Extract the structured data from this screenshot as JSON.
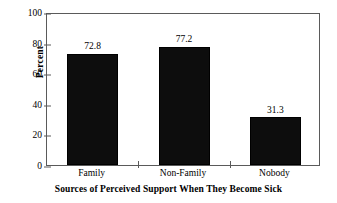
{
  "chart_data": {
    "type": "bar",
    "title": "",
    "subtitle": "",
    "xlabel": "Sources of Perceived Support When They Become Sick",
    "ylabel": "Percent",
    "categories": [
      "Family",
      "Non-Family",
      "Nobody"
    ],
    "values": [
      72.8,
      77.2,
      31.3
    ],
    "value_labels": [
      "72.8",
      "77.2",
      "31.3"
    ],
    "ylim": [
      0,
      100
    ],
    "ytick_labels": [
      "0",
      "20",
      "40",
      "60",
      "80",
      "100"
    ],
    "ytick_values": [
      0,
      20,
      40,
      60,
      80,
      100
    ],
    "grid": false,
    "legend": "none",
    "bar_color": "#0d0d0d",
    "axis_color": "#5a5a5a",
    "background_color": "#ffffff",
    "text_color": "#000000"
  }
}
